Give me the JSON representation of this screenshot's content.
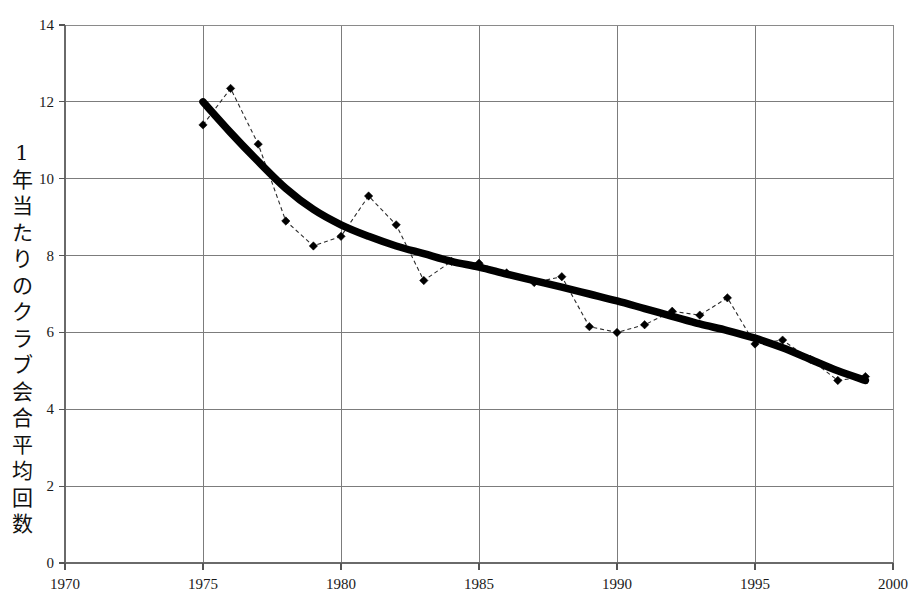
{
  "chart_data": {
    "type": "line",
    "title": "",
    "subtitle": "",
    "xlabel": "",
    "ylabel": "1年当たりのクラブ会合平均回数",
    "ylabel_chars": [
      "1",
      "年",
      "当",
      "た",
      "り",
      "の",
      "ク",
      "ラ",
      "ブ",
      "会",
      "合",
      "平",
      "均",
      "回",
      "数"
    ],
    "xlim": [
      1970,
      2000
    ],
    "ylim": [
      0,
      14
    ],
    "xticks": [
      1970,
      1975,
      1980,
      1985,
      1990,
      1995,
      2000
    ],
    "xtick_labels": [
      "1970",
      "1975",
      "1980",
      "1985",
      "1990",
      "1995",
      "2000"
    ],
    "yticks": [
      0,
      2,
      4,
      6,
      8,
      10,
      12,
      14
    ],
    "ytick_labels": [
      "0",
      "2",
      "4",
      "6",
      "8",
      "10",
      "12",
      "14"
    ],
    "grid": true,
    "legend": false,
    "legend_position": "none",
    "series": [
      {
        "name": "観測値",
        "style": "dashed-with-diamond-markers",
        "color": "#000000",
        "x": [
          1975,
          1976,
          1977,
          1978,
          1979,
          1980,
          1981,
          1982,
          1983,
          1984,
          1985,
          1986,
          1987,
          1988,
          1989,
          1990,
          1991,
          1992,
          1993,
          1994,
          1995,
          1996,
          1997,
          1998,
          1999
        ],
        "values": [
          11.4,
          12.35,
          10.9,
          8.9,
          8.25,
          8.5,
          9.55,
          8.8,
          7.35,
          7.85,
          7.8,
          7.55,
          7.3,
          7.45,
          6.15,
          6.0,
          6.2,
          6.55,
          6.45,
          6.9,
          5.7,
          5.8,
          5.3,
          4.75,
          4.85
        ]
      },
      {
        "name": "トレンド",
        "style": "thick-smooth-line",
        "color": "#000000",
        "x": [
          1975,
          1976,
          1977,
          1978,
          1979,
          1980,
          1981,
          1982,
          1983,
          1984,
          1985,
          1986,
          1987,
          1988,
          1989,
          1990,
          1991,
          1992,
          1993,
          1994,
          1995,
          1996,
          1997,
          1998,
          1999
        ],
        "values": [
          12.0,
          11.2,
          10.45,
          9.75,
          9.2,
          8.8,
          8.5,
          8.25,
          8.05,
          7.85,
          7.7,
          7.52,
          7.35,
          7.18,
          7.0,
          6.82,
          6.62,
          6.42,
          6.22,
          6.05,
          5.85,
          5.6,
          5.3,
          5.0,
          4.75
        ]
      }
    ],
    "colors": {
      "axis": "#6a6a6a",
      "grid": "#7c7c7c",
      "marker": "#000000",
      "trend": "#000000",
      "background": "#ffffff"
    }
  }
}
